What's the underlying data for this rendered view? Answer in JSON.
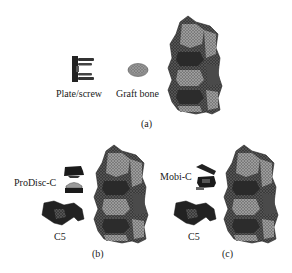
{
  "figure": {
    "panels": [
      {
        "id": "a",
        "caption": "(a)",
        "parts": [
          {
            "name": "plate-screw",
            "label": "Plate/screw"
          },
          {
            "name": "graft-bone",
            "label": "Graft bone"
          },
          {
            "name": "cervical-spine-model",
            "label": ""
          }
        ]
      },
      {
        "id": "b",
        "caption": "(b)",
        "parts": [
          {
            "name": "prodisc-c-implant",
            "label": "ProDisc-C"
          },
          {
            "name": "c5-vertebra",
            "label": "C5"
          },
          {
            "name": "cervical-spine-model",
            "label": ""
          }
        ]
      },
      {
        "id": "c",
        "caption": "(c)",
        "parts": [
          {
            "name": "mobi-c-implant",
            "label": "Mobi-C"
          },
          {
            "name": "c5-vertebra",
            "label": "C5"
          },
          {
            "name": "cervical-spine-model",
            "label": ""
          }
        ]
      }
    ],
    "colors": {
      "implant_dark": "#1e1e1e",
      "bone_mid": "#6a6a6a",
      "bone_light": "#a8a8a8",
      "graft": "#9a9a9a",
      "text": "#1a1a1a"
    }
  }
}
